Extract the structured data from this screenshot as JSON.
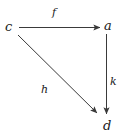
{
  "diagram": {
    "type": "commutative-diagram",
    "stroke_color": "#3a3a3a",
    "text_color": "#1a1a1a",
    "background_color": "#ffffff",
    "nodes": [
      {
        "id": "c",
        "label": "c",
        "x": 11,
        "y": 27
      },
      {
        "id": "a",
        "label": "a",
        "x": 109,
        "y": 26
      },
      {
        "id": "d",
        "label": "d",
        "x": 108,
        "y": 126
      }
    ],
    "edges": [
      {
        "id": "f",
        "label": "f",
        "from": "c",
        "to": "a",
        "orientation": "horizontal",
        "label_x": 55,
        "label_y": 13
      },
      {
        "id": "k",
        "label": "k",
        "from": "a",
        "to": "d",
        "orientation": "vertical",
        "label_x": 113,
        "label_y": 82
      },
      {
        "id": "h",
        "label": "h",
        "from": "c",
        "to": "d",
        "orientation": "diagonal",
        "label_x": 45,
        "label_y": 90
      }
    ]
  }
}
